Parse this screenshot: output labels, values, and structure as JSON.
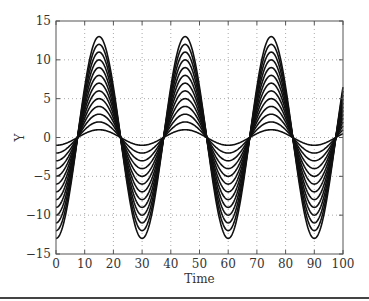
{
  "chart_data": {
    "type": "line",
    "title": "",
    "xlabel": "Time",
    "ylabel": "Y",
    "xlim": [
      0,
      100
    ],
    "ylim": [
      -15,
      15
    ],
    "xticks": [
      0,
      10,
      20,
      30,
      40,
      50,
      60,
      70,
      80,
      90,
      100
    ],
    "yticks": [
      -15,
      -10,
      -5,
      0,
      5,
      10,
      15
    ],
    "grid": "dotted",
    "legend": null,
    "period": 30,
    "phase_shift": 7.5,
    "series": [
      {
        "name": "A=1",
        "amplitude": 1
      },
      {
        "name": "A=2",
        "amplitude": 2
      },
      {
        "name": "A=3",
        "amplitude": 3
      },
      {
        "name": "A=4",
        "amplitude": 4
      },
      {
        "name": "A=5",
        "amplitude": 5
      },
      {
        "name": "A=6",
        "amplitude": 6
      },
      {
        "name": "A=7",
        "amplitude": 7
      },
      {
        "name": "A=8",
        "amplitude": 8
      },
      {
        "name": "A=9",
        "amplitude": 9
      },
      {
        "name": "A=10",
        "amplitude": 10
      },
      {
        "name": "A=11",
        "amplitude": 11
      },
      {
        "name": "A=12",
        "amplitude": 12
      },
      {
        "name": "A=13",
        "amplitude": 13
      }
    ],
    "line_color": "#111111"
  }
}
